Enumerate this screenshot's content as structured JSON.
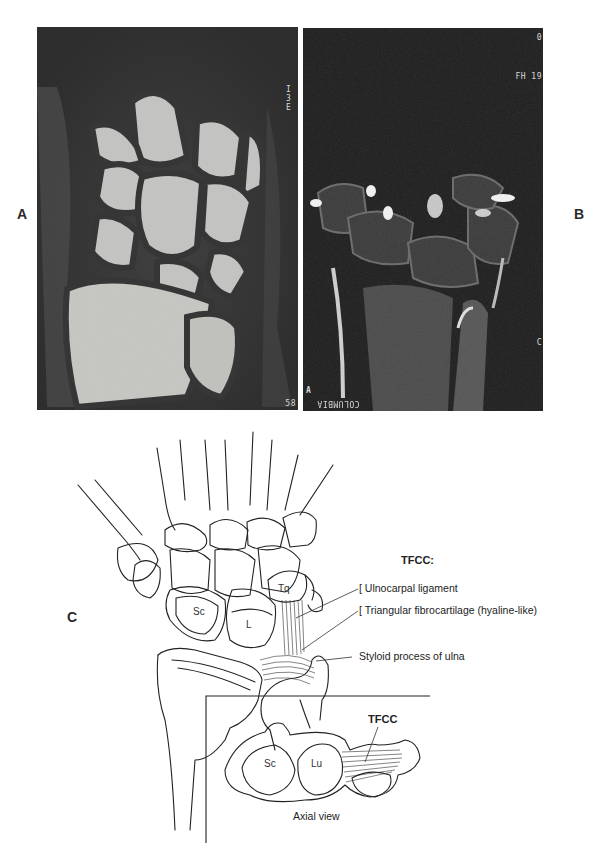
{
  "figure": {
    "panels": [
      {
        "id": "A",
        "label": "A",
        "type": "mri-t1-coronal-wrist",
        "overlay_text": {
          "top_right": "I 3 E",
          "bottom_right": "58"
        }
      },
      {
        "id": "B",
        "label": "B",
        "type": "mri-t2-coronal-wrist",
        "overlay_text": {
          "top_right_1": "0",
          "top_right_2": "FH 19",
          "bottom_left_marker": "A",
          "bottom_left": "COLUMBIA",
          "right_edge": "C"
        }
      },
      {
        "id": "C",
        "label": "C",
        "type": "anatomical-illustration"
      }
    ],
    "illustration": {
      "heading": "TFCC:",
      "callouts": [
        {
          "bracket": "[",
          "text": "Ulnocarpal ligament"
        },
        {
          "bracket": "[",
          "text": "Triangular fibrocartilage (hyaline-like)"
        },
        {
          "bracket": "",
          "text": "Styloid process of ulna"
        }
      ],
      "bone_labels": {
        "scaphoid": "Sc",
        "lunate": "L",
        "triquetrum": "Tq"
      },
      "inset": {
        "caption": "Axial view",
        "tfcc_label": "TFCC",
        "bone_labels": {
          "scaphoid": "Sc",
          "lunate": "Lu"
        }
      }
    }
  }
}
